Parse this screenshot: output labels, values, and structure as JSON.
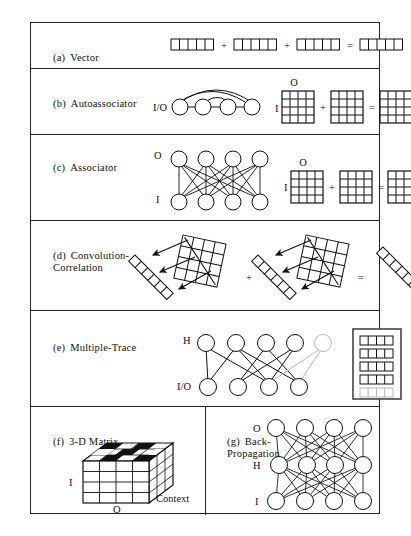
{
  "figure": {
    "panels": [
      {
        "id": "a",
        "tag": "(a)",
        "title": "Vector",
        "kind": "vector-sum",
        "cells_per_vector": 5,
        "terms": 3,
        "operators": [
          "+",
          "+",
          "="
        ]
      },
      {
        "id": "b",
        "tag": "(b)",
        "title": "Autoassociator",
        "kind": "network-plus-matrices",
        "node_label": "I/O",
        "nodes": 4,
        "matrix_rows": 4,
        "matrix_cols": 4,
        "matrix_row_label": "I",
        "matrix_col_label": "O",
        "matrices": 3,
        "operators": [
          "+",
          "="
        ]
      },
      {
        "id": "c",
        "tag": "(c)",
        "title": "Associator",
        "kind": "bipartite-plus-matrices",
        "top_label": "O",
        "bottom_label": "I",
        "top_nodes": 4,
        "bottom_nodes": 4,
        "matrix_rows": 4,
        "matrix_cols": 4,
        "matrix_row_label": "I",
        "matrix_col_label": "O",
        "matrices": 3,
        "operators": [
          "+",
          "="
        ]
      },
      {
        "id": "d",
        "tag": "(d)",
        "title": "Convolution-\nCorrelation",
        "kind": "convolution",
        "grid_rows": 4,
        "grid_cols": 4,
        "diag_cells": 6,
        "arrows": 3,
        "terms": 2,
        "operators": [
          "+",
          "="
        ]
      },
      {
        "id": "e",
        "tag": "(e)",
        "title": "Multiple-Trace",
        "kind": "trace-network",
        "top_label": "H",
        "bottom_label": "I/O",
        "top_nodes": 5,
        "bottom_nodes": 4,
        "faded_top_node_index": 4,
        "trace_rows": 5,
        "trace_cells": 4,
        "faded_trace_row_index": 4
      },
      {
        "id": "f",
        "tag": "(f)",
        "title": "3-D Matrix",
        "kind": "cube",
        "axis_left": "I",
        "axis_bottom": "O",
        "axis_right": "Context",
        "face_rows": 4,
        "face_cols": 4,
        "depth_slices": 3
      },
      {
        "id": "g",
        "tag": "(g)",
        "title": "Back-\nPropagation",
        "kind": "three-layer-network",
        "layer_labels": [
          "O",
          "H",
          "I"
        ],
        "nodes_per_layer": 4
      }
    ]
  },
  "style": {
    "ink": "#111111",
    "faded_ink": "#b9b9b9",
    "frame": "#222222",
    "background": "#ffffff"
  }
}
